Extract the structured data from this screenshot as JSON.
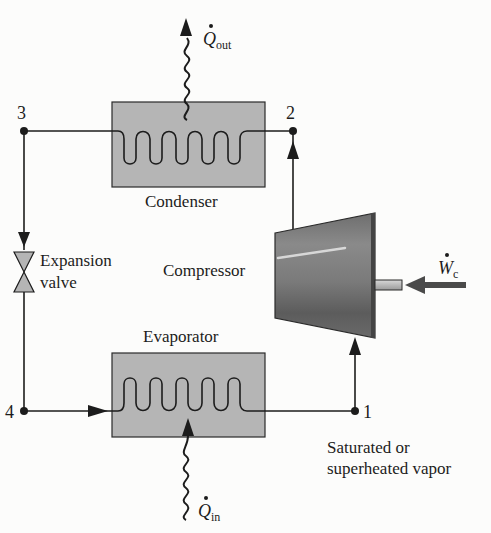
{
  "diagram": {
    "components": {
      "condenser": "Condenser",
      "evaporator": "Evaporator",
      "compressor": "Compressor",
      "expansion_valve_line1": "Expansion",
      "expansion_valve_line2": "valve"
    },
    "states": {
      "s1": "1",
      "s2": "2",
      "s3": "3",
      "s4": "4"
    },
    "state1_note_line1": "Saturated or",
    "state1_note_line2": "superheated vapor",
    "energy": {
      "q_out_symbol": "Q",
      "q_out_sub": "out",
      "q_in_symbol": "Q",
      "q_in_sub": "in",
      "w_c_symbol": "W",
      "w_c_sub": "c"
    },
    "colors": {
      "line": "#1c1c1c",
      "hx_fill": "#b3b3b3",
      "compressor_dark": "#5a5a5a",
      "compressor_light": "#9a9a9a",
      "background": "#fcfcfb"
    }
  }
}
